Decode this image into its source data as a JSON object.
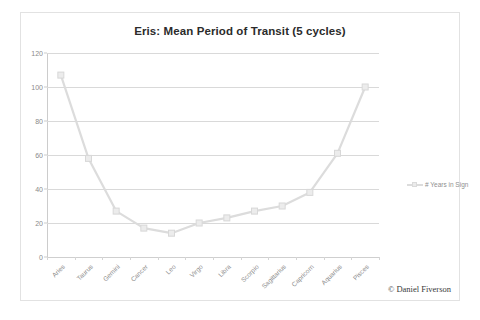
{
  "chart_data": {
    "type": "line",
    "title": "Eris: Mean Period of Transit (5 cycles)",
    "xlabel": "",
    "ylabel": "",
    "ylim": [
      0,
      120
    ],
    "yticks": [
      0,
      20,
      40,
      60,
      80,
      100,
      120
    ],
    "grid": true,
    "legend_position": "right",
    "categories": [
      "Aries",
      "Taurus",
      "Gemini",
      "Cancer",
      "Leo",
      "Virgo",
      "Libra",
      "Scorpio",
      "Sagittarius",
      "Capricorn",
      "Aquarius",
      "Pisces"
    ],
    "series": [
      {
        "name": "# Years in Sign",
        "values": [
          107,
          58,
          27,
          17,
          14,
          20,
          23,
          27,
          30,
          38,
          61,
          100
        ]
      }
    ]
  },
  "legend": {
    "entries": [
      {
        "label": "# Years in Sign",
        "color": "#dcdcdc"
      }
    ]
  },
  "attribution": {
    "text": "© Daniel Fiverson"
  },
  "colors": {
    "series_line": "#dcdcdc",
    "marker_fill": "#ececec",
    "marker_stroke": "#d8d8d8",
    "gridline": "#d9d9d9",
    "axis": "#cccccc",
    "title_text": "#2b2b2b",
    "tick_text": "#8a8a8a"
  }
}
